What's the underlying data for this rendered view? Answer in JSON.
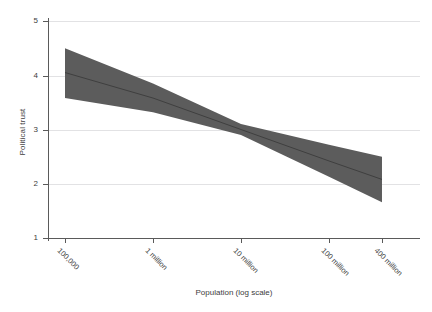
{
  "chart_data": {
    "type": "line",
    "title": "",
    "xlabel": "Population (log scale)",
    "ylabel": "Political trust",
    "x_scale": "log",
    "xlim": [
      60000,
      600000000
    ],
    "ylim": [
      1,
      5
    ],
    "grid": true,
    "legend": false,
    "x_tick_labels": [
      "100,000",
      "1 million",
      "10 million",
      "100 million",
      "400 million"
    ],
    "x_tick_values": [
      100000,
      1000000,
      10000000,
      100000000,
      400000000
    ],
    "y_tick_labels": [
      "1",
      "2",
      "3",
      "4",
      "5"
    ],
    "y_tick_values": [
      1,
      2,
      3,
      4,
      5
    ],
    "series": [
      {
        "name": "Predicted political trust",
        "kind": "line",
        "color": "#4a4a4a",
        "x": [
          100000,
          1000000,
          10000000,
          100000000,
          400000000
        ],
        "values": [
          4.05,
          3.58,
          3.0,
          2.42,
          2.08
        ]
      },
      {
        "name": "95% confidence interval",
        "kind": "band",
        "color": "#5c5c5c",
        "opacity": 1,
        "x": [
          100000,
          1000000,
          10000000,
          100000000,
          400000000
        ],
        "lower": [
          3.58,
          3.32,
          2.9,
          2.13,
          1.66
        ],
        "upper": [
          4.5,
          3.85,
          3.1,
          2.72,
          2.5
        ]
      }
    ]
  },
  "axes": {
    "y_title": "Political trust",
    "x_title": "Population (log scale)"
  },
  "colors": {
    "band": "#5c5c5c",
    "line": "#3f3f3f",
    "grid": "#e2e2e4",
    "axis": "#5a5a5a",
    "text": "#3d3d3d",
    "background": "#ffffff"
  }
}
